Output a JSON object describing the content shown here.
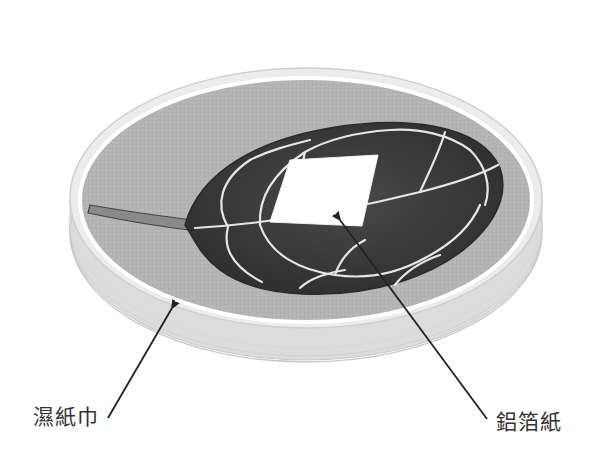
{
  "figure": {
    "colors": {
      "background": "#ffffff",
      "filter_paper": "#b3b3b3",
      "dish_rim": "#e6e6e6",
      "dish_wall": "#d6d6d6",
      "leaf": "#3c3c3c",
      "leaf_veins": "#e8e8e8",
      "foil": "#ffffff",
      "pointer": "#222222",
      "label_text": "#333333"
    }
  },
  "labels": {
    "wet_filter_paper": "濕紙巾",
    "aluminum_foil": "鋁箔紙"
  }
}
